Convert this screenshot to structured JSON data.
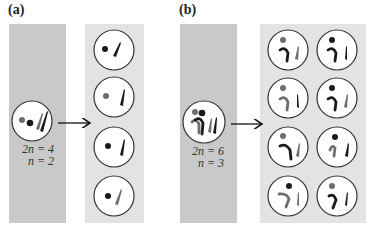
{
  "panels": [
    {
      "label": "(a)",
      "parent": {
        "ploidy_line1": "2n = 4",
        "ploidy_line2": "n = 2"
      },
      "daughter_count": 4
    },
    {
      "label": "(b)",
      "parent": {
        "ploidy_line1": "2n = 6",
        "ploidy_line2": "n = 3"
      },
      "daughter_count": 8
    }
  ],
  "colors": {
    "parent_background": "#c9c9c9",
    "daughter_background": "#e3e3e3",
    "chromosome_dark": "#1a1a1a",
    "chromosome_gray": "#6e6e6e",
    "cell_fill": "#ffffff",
    "cell_outline": "#333333"
  }
}
